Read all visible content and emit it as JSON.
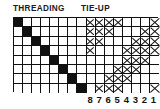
{
  "headers": {
    "threading": "THREADING",
    "tieup": "TIE-UP"
  },
  "grid": {
    "rows": 8,
    "cols": 16,
    "fill_color": "#111111",
    "line_color": "#111111",
    "background_color": "#ffffff"
  },
  "column_labels": [
    "8",
    "7",
    "6",
    "5",
    "4",
    "3",
    "2",
    "1"
  ],
  "chart_data": {
    "type": "heatmap",
    "xlabel": "",
    "ylabel": "",
    "sections": [
      {
        "name": "threading",
        "label": "THREADING",
        "col_start": 0,
        "col_end": 7,
        "marker": "filled",
        "cells": [
          {
            "row": 0,
            "col": 0
          },
          {
            "row": 1,
            "col": 1
          },
          {
            "row": 2,
            "col": 2
          },
          {
            "row": 3,
            "col": 3
          },
          {
            "row": 4,
            "col": 4
          },
          {
            "row": 5,
            "col": 5
          },
          {
            "row": 6,
            "col": 6
          },
          {
            "row": 7,
            "col": 7
          }
        ]
      },
      {
        "name": "tie-up",
        "label": "TIE-UP",
        "col_start": 8,
        "col_end": 11,
        "marker": "x",
        "cells": [
          {
            "row": 0,
            "col": 8
          },
          {
            "row": 0,
            "col": 9
          },
          {
            "row": 0,
            "col": 10
          },
          {
            "row": 0,
            "col": 11
          },
          {
            "row": 1,
            "col": 8
          },
          {
            "row": 1,
            "col": 9
          },
          {
            "row": 1,
            "col": 10
          },
          {
            "row": 2,
            "col": 8
          },
          {
            "row": 2,
            "col": 9
          },
          {
            "row": 3,
            "col": 8
          },
          {
            "row": 5,
            "col": 11
          },
          {
            "row": 6,
            "col": 10
          },
          {
            "row": 6,
            "col": 11
          },
          {
            "row": 7,
            "col": 9
          },
          {
            "row": 7,
            "col": 10
          },
          {
            "row": 7,
            "col": 11
          }
        ]
      },
      {
        "name": "treadling",
        "label": "",
        "col_start": 12,
        "col_end": 15,
        "marker": "x",
        "cells": [
          {
            "row": 0,
            "col": 15
          },
          {
            "row": 1,
            "col": 14
          },
          {
            "row": 1,
            "col": 15
          },
          {
            "row": 2,
            "col": 13
          },
          {
            "row": 2,
            "col": 14
          },
          {
            "row": 2,
            "col": 15
          },
          {
            "row": 3,
            "col": 12
          },
          {
            "row": 3,
            "col": 13
          },
          {
            "row": 3,
            "col": 14
          },
          {
            "row": 3,
            "col": 15
          },
          {
            "row": 4,
            "col": 12
          },
          {
            "row": 4,
            "col": 13
          },
          {
            "row": 4,
            "col": 14
          },
          {
            "row": 5,
            "col": 12
          },
          {
            "row": 5,
            "col": 13
          },
          {
            "row": 6,
            "col": 12
          },
          {
            "row": 7,
            "col": 15
          }
        ]
      }
    ],
    "bottom_axis_labels": [
      "8",
      "7",
      "6",
      "5",
      "4",
      "3",
      "2",
      "1"
    ]
  }
}
